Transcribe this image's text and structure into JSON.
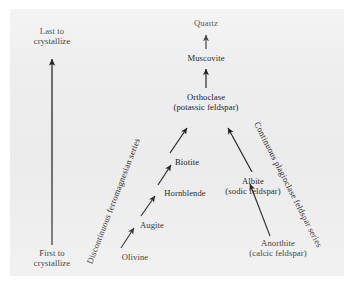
{
  "figure": {
    "type": "diagram",
    "background_color": "#eeeeee",
    "ink_color": "#222020"
  },
  "axis": {
    "top_label_line1": "Last to",
    "top_label_line2": "crystallize",
    "bottom_label_line1": "First to",
    "bottom_label_line2": "crystallize",
    "arrow_direction": "up"
  },
  "series": {
    "left": {
      "label": "Discontinuous ferromagnesian series",
      "minerals": [
        {
          "name": "Olivine",
          "note": ""
        },
        {
          "name": "Augite",
          "note": ""
        },
        {
          "name": "Hornblende",
          "note": ""
        },
        {
          "name": "Biotite",
          "note": ""
        }
      ]
    },
    "right": {
      "label": "Continuous plagioclase feldspar series",
      "minerals": [
        {
          "name": "Anorthite",
          "note": "(calcic feldspar)"
        },
        {
          "name": "Albite",
          "note": "(sodic feldspar)"
        }
      ]
    },
    "apex": {
      "minerals": [
        {
          "name": "Orthoclase",
          "note": "(potassic feldspar)"
        },
        {
          "name": "Muscovite",
          "note": ""
        },
        {
          "name": "Quartz",
          "note": ""
        }
      ]
    }
  },
  "nodes": {
    "quartz": "Quartz",
    "muscovite": "Muscovite",
    "orthoclase": "Orthoclase",
    "orthoclase_note": "(potassic feldspar)",
    "biotite": "Biotite",
    "hornblende": "Hornblende",
    "augite": "Augite",
    "olivine": "Olivine",
    "albite": "Albite",
    "albite_note": "(sodic feldspar)",
    "anorthite": "Anorthite",
    "anorthite_note": "(calcic feldspar)"
  }
}
